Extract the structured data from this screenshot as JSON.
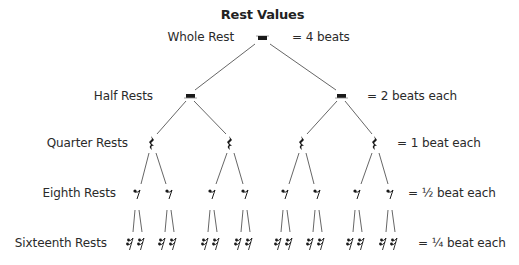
{
  "title": "Rest Values",
  "levels": [
    {
      "name": "Whole Rest",
      "value": "= 4 beats",
      "count": 1
    },
    {
      "name": "Half Rests",
      "value": "= 2 beats each",
      "count": 2
    },
    {
      "name": "Quarter Rests",
      "value": "= 1 beat each",
      "count": 4
    },
    {
      "name": "Eighth Rests",
      "value": "= ½ beat each",
      "count": 8
    },
    {
      "name": "Sixteenth Rests",
      "value": "= ¼ beat each",
      "count": 16
    }
  ],
  "colors": {
    "line": "#555555",
    "symbol": "#1a1a1a",
    "text": "#2a2a2a"
  }
}
